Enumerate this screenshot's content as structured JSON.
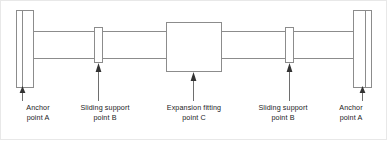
{
  "figure": {
    "type": "piping-expansion-schematic",
    "title": "",
    "background_color": "#ffffff",
    "line_color": "#8c8c8c",
    "dark_line_color": "#595959",
    "text_color": "#1c1c1c",
    "border_color": "#e8e8e8"
  },
  "components": [
    {
      "id": "anchor-left",
      "kind": "anchor",
      "shape": "tall-rectangle-with-inner-line",
      "x": 16,
      "y": 10,
      "width": 18,
      "height": 78,
      "inner_line_x": 22
    },
    {
      "id": "sliding-support-left",
      "kind": "sliding-support",
      "shape": "narrow-vertical-rectangle",
      "x": 94,
      "y": 27,
      "width": 9,
      "height": 36
    },
    {
      "id": "expansion-fitting",
      "kind": "expansion-fitting",
      "shape": "square",
      "x": 166,
      "y": 22,
      "width": 56,
      "height": 50
    },
    {
      "id": "sliding-support-right",
      "kind": "sliding-support",
      "shape": "narrow-vertical-rectangle",
      "x": 285,
      "y": 27,
      "width": 9,
      "height": 36
    },
    {
      "id": "anchor-right",
      "kind": "anchor",
      "shape": "tall-rectangle-with-inner-line",
      "x": 353,
      "y": 10,
      "width": 19,
      "height": 78,
      "inner_line_x": 366
    }
  ],
  "pipe": {
    "top_line_y": 31,
    "bottom_line_y": 58,
    "segments": [
      {
        "from_x": 34,
        "to_x": 94
      },
      {
        "from_x": 103,
        "to_x": 166
      },
      {
        "from_x": 222,
        "to_x": 285
      },
      {
        "from_x": 294,
        "to_x": 353
      }
    ]
  },
  "leaders": [
    {
      "id": "leader-anchor-left",
      "x": 22,
      "tip_y": 88,
      "base_y": 101
    },
    {
      "id": "leader-support-left",
      "x": 99,
      "tip_y": 63,
      "base_y": 101
    },
    {
      "id": "leader-fitting",
      "x": 194,
      "tip_y": 72,
      "base_y": 101
    },
    {
      "id": "leader-support-right",
      "x": 290,
      "tip_y": 63,
      "base_y": 101
    },
    {
      "id": "leader-anchor-right",
      "x": 362,
      "tip_y": 88,
      "base_y": 101
    }
  ],
  "labels": {
    "anchor_left": {
      "line1": "Anchor",
      "line2": "point A"
    },
    "support_left": {
      "line1": "Sliding support",
      "line2": "point B"
    },
    "fitting": {
      "line1": "Expansion fitting",
      "line2": "point C"
    },
    "support_right": {
      "line1": "Sliding support",
      "line2": "point B"
    },
    "anchor_right": {
      "line1": "Anchor",
      "line2": "point A"
    }
  }
}
